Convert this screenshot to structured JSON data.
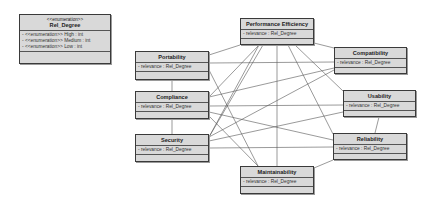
{
  "enumeration": {
    "stereotype": "<<enumeration>>",
    "name": "Rel_Degree",
    "literals": [
      "- <<enumeration>> High : int",
      "- <<enumeration>> Medium : int",
      "- <<enumeration>> Low : int"
    ]
  },
  "classes": {
    "performance_efficiency": {
      "name": "Performance Efficiency",
      "attr": "- relevance : Rel_Degree"
    },
    "portability": {
      "name": "Portability",
      "attr": "- relevance : Rel_Degree"
    },
    "compatibility": {
      "name": "Compatibility",
      "attr": "- relevance : Rel_Degree"
    },
    "compliance": {
      "name": "Compliance",
      "attr": "- relevance : Rel_Degree"
    },
    "usability": {
      "name": "Usability",
      "attr": "- relevance : Rel_Degree"
    },
    "security": {
      "name": "Security",
      "attr": "- relevance : Rel_Degree"
    },
    "reliability": {
      "name": "Reliability",
      "attr": "- relevance : Rel_Degree"
    },
    "maintainability": {
      "name": "Maintainability",
      "attr": "- relevance : Rel_Degree"
    }
  },
  "colors": {
    "box_fill": "#d9d9d9",
    "border": "#3a3a3a",
    "line": "#444444"
  }
}
